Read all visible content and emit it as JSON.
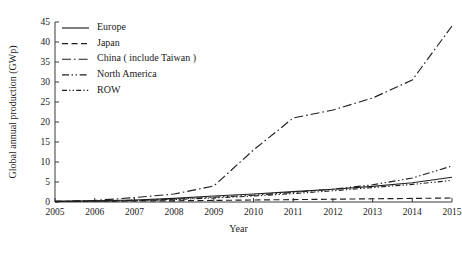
{
  "chart_data": {
    "type": "line",
    "title": "",
    "xlabel": "Year",
    "ylabel": "Global annual production (GWp)",
    "x": [
      2005,
      2006,
      2007,
      2008,
      2009,
      2010,
      2011,
      2012,
      2013,
      2014,
      2015
    ],
    "xticklabels": [
      "2005",
      "2006",
      "2007",
      "2008",
      "2009",
      "2010",
      "2011",
      "2012",
      "2013",
      "2014",
      "2015"
    ],
    "yticklabels": [
      "0",
      "5",
      "10",
      "15",
      "20",
      "25",
      "30",
      "35",
      "40",
      "45"
    ],
    "yticks": [
      0,
      5,
      10,
      15,
      20,
      25,
      30,
      35,
      40,
      45
    ],
    "xlim": [
      2005,
      2015
    ],
    "ylim": [
      0,
      45
    ],
    "grid": false,
    "legend_position": "upper left",
    "series": [
      {
        "name": "Europe",
        "dash": "solid",
        "values": [
          0.2,
          0.3,
          0.5,
          0.9,
          1.5,
          2.0,
          2.6,
          3.2,
          3.9,
          4.8,
          6.2
        ]
      },
      {
        "name": "Japan",
        "dash": "dashed",
        "values": [
          0.15,
          0.2,
          0.25,
          0.3,
          0.4,
          0.5,
          0.6,
          0.7,
          0.8,
          0.9,
          1.0
        ]
      },
      {
        "name": "China ( include Taiwan )",
        "dash": "dash-dot",
        "values": [
          0.1,
          0.4,
          1.1,
          2.0,
          4.0,
          13.0,
          21.0,
          23.0,
          26.0,
          30.5,
          44.0
        ]
      },
      {
        "name": "North America",
        "dash": "dash-dot-dot",
        "values": [
          0.15,
          0.25,
          0.4,
          0.7,
          1.2,
          1.7,
          2.4,
          3.2,
          4.3,
          6.0,
          9.0
        ]
      },
      {
        "name": "ROW",
        "dash": "dotted",
        "values": [
          0.1,
          0.2,
          0.35,
          0.6,
          1.0,
          1.5,
          2.1,
          2.8,
          3.6,
          4.4,
          5.4
        ]
      }
    ]
  },
  "legend": {
    "items": [
      {
        "label": "Europe"
      },
      {
        "label": "Japan"
      },
      {
        "label": "China ( include Taiwan )"
      },
      {
        "label": "North America"
      },
      {
        "label": "ROW"
      }
    ]
  }
}
